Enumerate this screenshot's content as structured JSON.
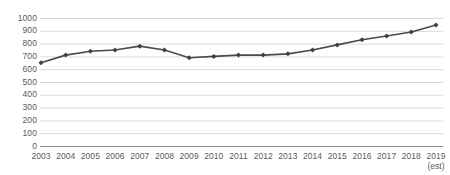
{
  "chart_data": {
    "type": "line",
    "title": "",
    "subtitle": "",
    "xlabel": "",
    "ylabel": "",
    "categories": [
      "2003",
      "2004",
      "2005",
      "2006",
      "2007",
      "2008",
      "2009",
      "2010",
      "2011",
      "2012",
      "2013",
      "2014",
      "2015",
      "2016",
      "2017",
      "2018",
      "2019"
    ],
    "category_sublabels": [
      "",
      "",
      "",
      "",
      "",
      "",
      "",
      "",
      "",
      "",
      "",
      "",
      "",
      "",
      "",
      "",
      "(est)"
    ],
    "values": [
      650,
      710,
      740,
      750,
      780,
      750,
      690,
      700,
      710,
      710,
      720,
      750,
      790,
      830,
      860,
      890,
      945
    ],
    "series": [
      {
        "name": "",
        "values": [
          650,
          710,
          740,
          750,
          780,
          750,
          690,
          700,
          710,
          710,
          720,
          750,
          790,
          830,
          860,
          890,
          945
        ]
      }
    ],
    "ylim": [
      0,
      1000
    ],
    "yticks": [
      0,
      100,
      200,
      300,
      400,
      500,
      600,
      700,
      800,
      900,
      1000
    ],
    "ytick_labels": [
      "0",
      "100",
      "200",
      "300",
      "400",
      "500",
      "600",
      "700",
      "800",
      "900",
      "1000"
    ],
    "grid": true,
    "grid_axis": "y",
    "legend": false,
    "legend_position": "none",
    "markers": true,
    "marker_shape": "diamond",
    "colors": {
      "line": "#4a4a4a",
      "marker": "#3f3f3f",
      "grid": "#d9d9d9",
      "axis": "#8c8c8c",
      "text": "#5a5a5a",
      "background": "#ffffff"
    }
  }
}
